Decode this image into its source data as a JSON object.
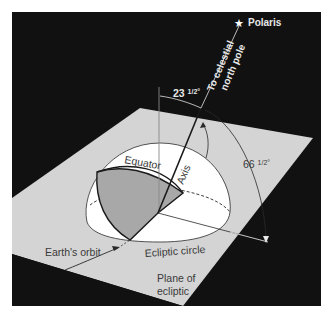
{
  "figure": {
    "background_color": "#111111",
    "plane_color": "#d4d4d4",
    "hemisphere_color": "#ffffff",
    "shaded_sector_color": "#a8a8a8",
    "line_color": "#2a2a2a"
  },
  "labels": {
    "polaris": "Polaris",
    "celestial_line1": "To celestial",
    "celestial_line2": "north pole",
    "angle_axis": "23 ½°",
    "angle_axis_main": "23 ",
    "angle_axis_frac": "1/2",
    "angle_axis_deg": "°",
    "angle_plane_main": "66 ",
    "angle_plane_frac": "1/2",
    "angle_plane_deg": "°",
    "equator": "Equator",
    "axis": "Axis",
    "ecliptic_circle": "Ecliptic circle",
    "earths_orbit": "Earth's orbit",
    "plane_line1": "Plane of",
    "plane_line2": "ecliptic"
  },
  "icons": {
    "polaris_star": "★"
  }
}
